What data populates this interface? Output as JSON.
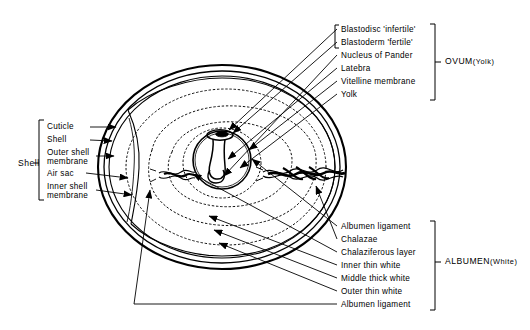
{
  "diagram": {
    "background": "#ffffff",
    "ink": "#000000"
  },
  "groups": {
    "shell": {
      "label": "Shell",
      "x": 18,
      "y": 163
    },
    "ovum": {
      "label": "OVUM",
      "paren_open": "(",
      "sub": "Yolk",
      "paren_close": ")",
      "x": 445,
      "y": 62
    },
    "albumen": {
      "label": "ALBUMEN",
      "paren_open": "(",
      "sub": "White",
      "paren_close": ")",
      "x": 445,
      "y": 262
    }
  },
  "labels": {
    "shell_group": [
      {
        "text": "Cuticle",
        "x": 47,
        "y": 127
      },
      {
        "text": "Shell",
        "x": 47,
        "y": 140
      },
      {
        "text": "Outer shell",
        "x": 47,
        "y": 152
      },
      {
        "text": "membrane",
        "x": 47,
        "y": 160
      },
      {
        "text": "Air sac",
        "x": 47,
        "y": 173
      },
      {
        "text": "Inner shell",
        "x": 47,
        "y": 186
      },
      {
        "text": "membrane",
        "x": 47,
        "y": 194
      }
    ],
    "ovum_group": [
      {
        "text": "Blastodisc 'infertile'",
        "x": 341,
        "y": 31
      },
      {
        "text": "Blastoderm 'fertile'",
        "x": 341,
        "y": 44
      },
      {
        "text": "Nucleus of Pander",
        "x": 341,
        "y": 57
      },
      {
        "text": "Latebra",
        "x": 341,
        "y": 70
      },
      {
        "text": "Vitelline membrane",
        "x": 341,
        "y": 83
      },
      {
        "text": "Yolk",
        "x": 341,
        "y": 96
      }
    ],
    "albumen_group": [
      {
        "text": "Albumen ligament",
        "x": 341,
        "y": 228
      },
      {
        "text": "Chalazae",
        "x": 341,
        "y": 241
      },
      {
        "text": "Chalaziferous layer",
        "x": 341,
        "y": 254
      },
      {
        "text": "Inner thin white",
        "x": 341,
        "y": 267
      },
      {
        "text": "Middle thick white",
        "x": 341,
        "y": 280
      },
      {
        "text": "Outer thin white",
        "x": 341,
        "y": 293
      },
      {
        "text": "Albumen ligament",
        "x": 341,
        "y": 306
      }
    ]
  },
  "parts": {
    "shell_layers": [
      "cuticle",
      "shell",
      "outer-shell-membrane",
      "air-sac",
      "inner-shell-membrane"
    ],
    "ovum_parts": [
      "blastodisc",
      "blastoderm",
      "nucleus-of-pander",
      "latebra",
      "vitelline-membrane",
      "yolk"
    ],
    "albumen_parts": [
      "albumen-ligament-upper",
      "chalazae",
      "chalaziferous-layer",
      "inner-thin-white",
      "middle-thick-white",
      "outer-thin-white",
      "albumen-ligament-lower"
    ]
  }
}
